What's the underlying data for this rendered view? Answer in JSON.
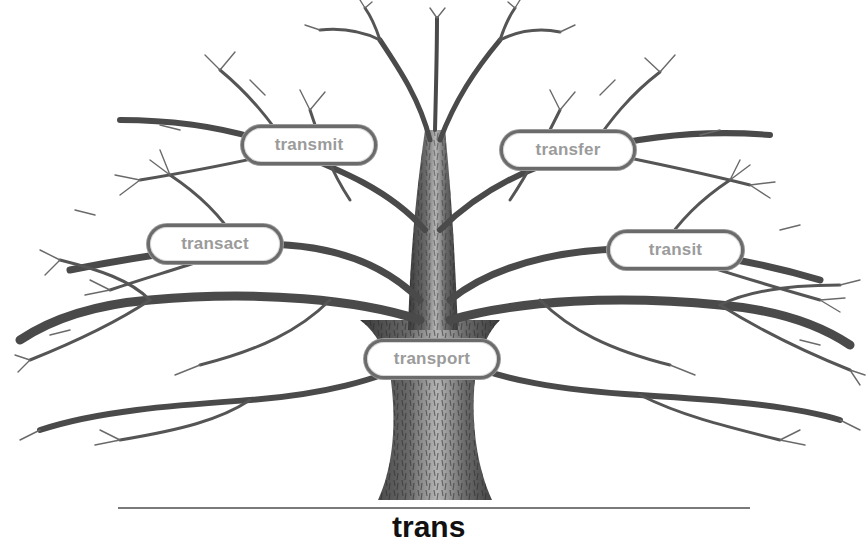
{
  "diagram": {
    "type": "word-tree",
    "root": {
      "label": "trans",
      "partially_visible": true
    },
    "branches": [
      {
        "id": "transmit",
        "label": "transmit",
        "x": 241,
        "y": 125,
        "w": 136
      },
      {
        "id": "transfer",
        "label": "transfer",
        "x": 500,
        "y": 130,
        "w": 136
      },
      {
        "id": "transact",
        "label": "transact",
        "x": 147,
        "y": 224,
        "w": 136
      },
      {
        "id": "transit",
        "label": "transit",
        "x": 607,
        "y": 230,
        "w": 137
      },
      {
        "id": "transport",
        "label": "transport",
        "x": 364,
        "y": 339,
        "w": 136
      }
    ],
    "colors": {
      "branch": "#4a4a4a",
      "label_text": "#9b9b9b",
      "label_border": "#6b6b6b",
      "background": "#ffffff",
      "ground_line": "#7a7a7a"
    }
  }
}
